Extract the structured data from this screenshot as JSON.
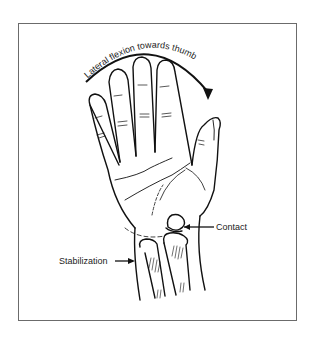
{
  "figure": {
    "arc_label": "Lateral flexion towards thumb",
    "labels": {
      "contact": "Contact",
      "stabilization": "Stabilization"
    },
    "colors": {
      "line": "#111111",
      "frame": "#6b6b6b",
      "background": "#ffffff"
    }
  }
}
